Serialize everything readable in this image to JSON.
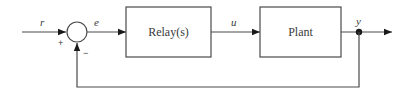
{
  "diagram": {
    "type": "block-diagram",
    "colors": {
      "line": "#4a4a4a",
      "text": "#3a3a3a",
      "background": "#ffffff"
    },
    "signals": {
      "reference": "r",
      "error": "e",
      "control": "u",
      "output": "y"
    },
    "blocks": {
      "relay": "Relay(s)",
      "plant": "Plant"
    },
    "summing_junction": {
      "plus_sign": "+",
      "minus_sign": "−"
    }
  }
}
